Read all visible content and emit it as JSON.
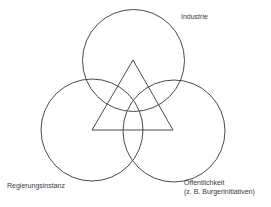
{
  "diagram": {
    "type": "three-circle overlap with central triangle",
    "stroke_color": "#4a4a4a",
    "circles": [
      {
        "name": "Industrie",
        "cx": 133.5,
        "cy": 60.5,
        "r": 51
      },
      {
        "name": "Regierungsinstanz",
        "cx": 92,
        "cy": 130,
        "r": 51
      },
      {
        "name": "Öffentlichkeit",
        "cx": 174,
        "cy": 131,
        "r": 51
      }
    ],
    "triangle": {
      "points": "133,60 92,130 173,130"
    },
    "labels": {
      "industrie": "Industrie",
      "regierungsinstanz": "Regierungsinstanz",
      "oeffentlichkeit_line1": "Öffentlichkeit",
      "oeffentlichkeit_line2": "(z. B. Burgerinitiativen)"
    }
  }
}
